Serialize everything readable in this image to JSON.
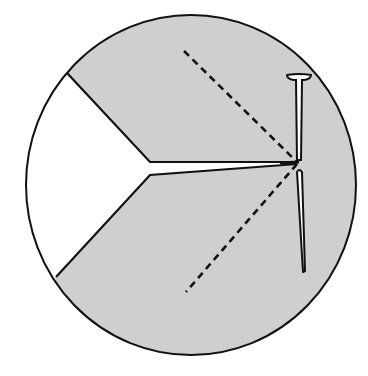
{
  "diagram": {
    "colors": {
      "background": "#ffffff",
      "wood_fill": "#cfcfcf",
      "outline": "#111111",
      "wedge_fill": "#ffffff"
    },
    "log": {
      "cx": 191,
      "cy": 185,
      "rx": 165,
      "ry": 170
    },
    "wedge_cut": {
      "upper_edge": [
        [
          67,
          73
        ],
        [
          150,
          162
        ],
        [
          297,
          162
        ]
      ],
      "lower_edge": [
        [
          56,
          277
        ],
        [
          150,
          175
        ],
        [
          297,
          164
        ]
      ]
    },
    "nail": {
      "head": [
        [
          287,
          77
        ],
        [
          311,
          77
        ]
      ],
      "upper_shank_bottom": [
        299,
        161
      ],
      "lower_shank": [
        [
          297,
          170
        ],
        [
          305,
          272
        ]
      ]
    },
    "dashed_lines": [
      {
        "from": [
          184,
          51
        ],
        "to": [
          297,
          162
        ]
      },
      {
        "from": [
          297,
          164
        ],
        "to": [
          186,
          292
        ]
      }
    ]
  }
}
